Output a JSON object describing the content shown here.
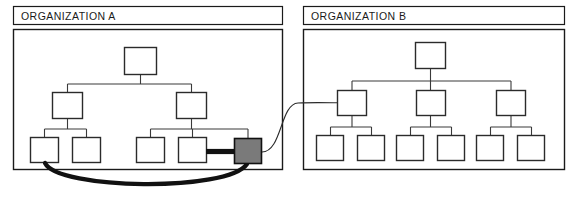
{
  "diagram": {
    "type": "organization-network-diagram",
    "background_color": "#ffffff",
    "stroke_color": "#1a1a1a",
    "node_fill": "#ffffff",
    "highlight_fill": "#7a7a7a",
    "panels": [
      {
        "id": "organization-a",
        "title": "ORGANIZATION A",
        "title_box": {
          "x": 13,
          "y": 6,
          "width": 270,
          "height": 19
        },
        "body_box": {
          "x": 13,
          "y": 29,
          "width": 270,
          "height": 141
        },
        "levels": 3,
        "node_count": 8,
        "nodes": [
          {
            "id": "a-root",
            "level": 1,
            "x": 124,
            "y": 47,
            "width": 33,
            "height": 28,
            "fill": "#ffffff"
          },
          {
            "id": "a-m1",
            "level": 2,
            "x": 52,
            "y": 92,
            "width": 31,
            "height": 27,
            "fill": "#ffffff"
          },
          {
            "id": "a-m2",
            "level": 2,
            "x": 176,
            "y": 92,
            "width": 31,
            "height": 27,
            "fill": "#ffffff"
          },
          {
            "id": "a-l1",
            "level": 3,
            "x": 30,
            "y": 137,
            "width": 29,
            "height": 26,
            "fill": "#ffffff"
          },
          {
            "id": "a-l2",
            "level": 3,
            "x": 72,
            "y": 137,
            "width": 29,
            "height": 26,
            "fill": "#ffffff"
          },
          {
            "id": "a-l3",
            "level": 3,
            "x": 136,
            "y": 137,
            "width": 29,
            "height": 26,
            "fill": "#ffffff"
          },
          {
            "id": "a-l4",
            "level": 3,
            "x": 178,
            "y": 137,
            "width": 29,
            "height": 26,
            "fill": "#ffffff"
          },
          {
            "id": "a-l5",
            "level": 3,
            "x": 234,
            "y": 138,
            "width": 28,
            "height": 26,
            "fill": "#7a7a7a",
            "highlighted": true
          }
        ]
      },
      {
        "id": "organization-b",
        "title": "ORGANIZATION B",
        "title_box": {
          "x": 303,
          "y": 6,
          "width": 262,
          "height": 19
        },
        "body_box": {
          "x": 303,
          "y": 29,
          "width": 262,
          "height": 141
        },
        "levels": 3,
        "node_count": 10,
        "nodes": [
          {
            "id": "b-root",
            "level": 1,
            "x": 415,
            "y": 42,
            "width": 31,
            "height": 27,
            "fill": "#ffffff"
          },
          {
            "id": "b-m1",
            "level": 2,
            "x": 337,
            "y": 90,
            "width": 30,
            "height": 26,
            "fill": "#ffffff"
          },
          {
            "id": "b-m2",
            "level": 2,
            "x": 416,
            "y": 90,
            "width": 30,
            "height": 26,
            "fill": "#ffffff"
          },
          {
            "id": "b-m3",
            "level": 2,
            "x": 496,
            "y": 90,
            "width": 30,
            "height": 26,
            "fill": "#ffffff"
          },
          {
            "id": "b-l1",
            "level": 3,
            "x": 316,
            "y": 135,
            "width": 28,
            "height": 26,
            "fill": "#ffffff"
          },
          {
            "id": "b-l2",
            "level": 3,
            "x": 357,
            "y": 135,
            "width": 28,
            "height": 26,
            "fill": "#ffffff"
          },
          {
            "id": "b-l3",
            "level": 3,
            "x": 396,
            "y": 135,
            "width": 28,
            "height": 26,
            "fill": "#ffffff"
          },
          {
            "id": "b-l4",
            "level": 3,
            "x": 437,
            "y": 135,
            "width": 28,
            "height": 26,
            "fill": "#ffffff"
          },
          {
            "id": "b-l5",
            "level": 3,
            "x": 476,
            "y": 135,
            "width": 28,
            "height": 26,
            "fill": "#ffffff"
          },
          {
            "id": "b-l6",
            "level": 3,
            "x": 517,
            "y": 135,
            "width": 28,
            "height": 26,
            "fill": "#ffffff"
          }
        ]
      }
    ],
    "links": [
      {
        "id": "thick-intra-link",
        "from": "a-l1",
        "to": "a-l5",
        "style": "thick-curve",
        "stroke_width": 4.2
      },
      {
        "id": "thick-bar-link",
        "from": "a-l4",
        "to": "a-l5",
        "style": "thick-bar",
        "stroke_width": 5
      },
      {
        "id": "thin-inter-link",
        "from": "a-l5",
        "to": "b-m1",
        "style": "thin-s-curve",
        "stroke_width": 1.1
      }
    ]
  }
}
